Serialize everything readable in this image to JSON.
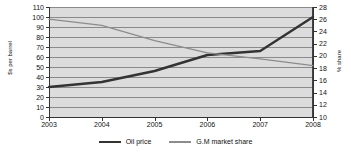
{
  "chart_data": {
    "type": "line",
    "title": "",
    "xlabel": "",
    "grid": true,
    "legend_position": "bottom",
    "x": [
      2003,
      2004,
      2005,
      2006,
      2007,
      2008
    ],
    "xtick_labels": [
      "2003",
      "2004",
      "2005",
      "2006",
      "2007",
      "2008"
    ],
    "axes": {
      "left": {
        "label": "$s per barrel",
        "min": 0,
        "max": 110,
        "step": 10,
        "ticks": [
          0,
          10,
          20,
          30,
          40,
          50,
          60,
          70,
          80,
          90,
          100,
          110
        ],
        "tick_labels": [
          "0",
          "10",
          "20",
          "30",
          "40",
          "50",
          "60",
          "70",
          "80",
          "90",
          "100",
          "110"
        ]
      },
      "right": {
        "label": "% share",
        "min": 10,
        "max": 28,
        "step": 2,
        "ticks": [
          10,
          12,
          14,
          16,
          18,
          20,
          22,
          24,
          26,
          28
        ],
        "tick_labels": [
          "10",
          "12",
          "14",
          "16",
          "18",
          "20",
          "22",
          "24",
          "26",
          "28"
        ]
      }
    },
    "series": [
      {
        "name": "Oil price",
        "axis": "left",
        "color": "#333333",
        "width": 2.4,
        "values": [
          30,
          35,
          46,
          62,
          66,
          100
        ]
      },
      {
        "name": "G.M market share",
        "axis": "right",
        "color": "#8c8c8c",
        "width": 1.2,
        "values": [
          26.0,
          25.0,
          22.5,
          20.5,
          19.5,
          18.4
        ]
      }
    ],
    "legend": [
      {
        "label": "Oil price",
        "swatch": "oil"
      },
      {
        "label": "G.M market share",
        "swatch": "gm"
      }
    ]
  },
  "colors": {
    "plot_background": "#dcdcdc",
    "gridline": "#8a8a8a",
    "axis": "#333333",
    "oil_price": "#333333",
    "gm_market_share": "#8c8c8c"
  }
}
